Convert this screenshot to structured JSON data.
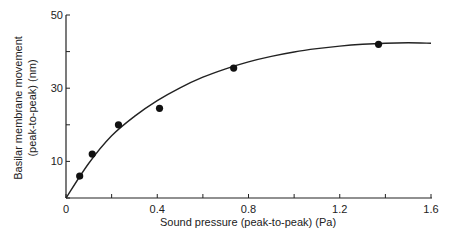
{
  "chart_data": {
    "type": "scatter",
    "title": "",
    "xlabel": "Sound pressure (peak-to-peak) (Pa)",
    "ylabel_line1": "Basilar membrane movement",
    "ylabel_line2": "(peak-to-peak) (nm)",
    "xlim": [
      0,
      1.6
    ],
    "ylim": [
      0,
      50
    ],
    "x_ticks": [
      0,
      0.2,
      0.4,
      0.6,
      0.8,
      1.0,
      1.2,
      1.4,
      1.6
    ],
    "x_tick_labels": [
      "0",
      "0.4",
      "0.8",
      "1.2",
      "1.6"
    ],
    "x_tick_label_values": [
      0,
      0.4,
      0.8,
      1.2,
      1.6
    ],
    "y_ticks": [
      0,
      10,
      20,
      30,
      40,
      50
    ],
    "y_tick_labels": [
      "0",
      "10",
      "30",
      "50"
    ],
    "y_tick_label_values": [
      0,
      10,
      30,
      50
    ],
    "grid": false,
    "legend": null,
    "series": [
      {
        "name": "Measured points",
        "kind": "scatter",
        "x": [
          0.06,
          0.115,
          0.23,
          0.41,
          0.735,
          1.37
        ],
        "y": [
          6,
          12,
          20,
          24.5,
          35.5,
          42
        ]
      },
      {
        "name": "Fitted curve",
        "kind": "line",
        "x": [
          0,
          0.1,
          0.2,
          0.3,
          0.4,
          0.5,
          0.6,
          0.7,
          0.8,
          0.9,
          1.0,
          1.1,
          1.2,
          1.3,
          1.4,
          1.5,
          1.6
        ],
        "y": [
          0,
          9.5,
          17,
          22.3,
          26.6,
          30.1,
          33.0,
          35.3,
          37.2,
          38.7,
          39.9,
          40.8,
          41.5,
          42.0,
          42.3,
          42.4,
          42.3
        ]
      }
    ]
  }
}
